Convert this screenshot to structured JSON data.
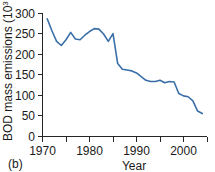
{
  "panel": {
    "label": "(b)"
  },
  "chart_data": {
    "type": "line",
    "title": "",
    "xlabel": "Year",
    "ylabel": "BOD mass emissions (10",
    "ylabel_sup": "3",
    "ylabel_tail": " mt)",
    "xlim": [
      1970,
      2005
    ],
    "ylim": [
      0,
      300
    ],
    "grid": false,
    "legend": "none",
    "xticks": [
      1970,
      1980,
      1990,
      2000
    ],
    "xtick_labels": [
      "1970",
      "1980",
      "1990",
      "2000"
    ],
    "xminorticks": [
      1975,
      1985,
      1995,
      2005
    ],
    "yticks": [
      0,
      50,
      100,
      150,
      200,
      250,
      300
    ],
    "ytick_labels": [
      "0",
      "50",
      "100",
      "150",
      "200",
      "250",
      "300"
    ],
    "line_color": "#3a6fa8",
    "series": [
      {
        "name": "BOD mass emissions",
        "x": [
          1971,
          1972,
          1973,
          1974,
          1975,
          1976,
          1977,
          1978,
          1979,
          1980,
          1981,
          1982,
          1983,
          1984,
          1985,
          1986,
          1987,
          1988,
          1989,
          1990,
          1991,
          1992,
          1993,
          1994,
          1995,
          1996,
          1997,
          1998,
          1999,
          2000,
          2001,
          2002,
          2003,
          2004
        ],
        "values": [
          287,
          258,
          232,
          222,
          236,
          254,
          238,
          236,
          247,
          256,
          263,
          262,
          250,
          232,
          251,
          178,
          164,
          162,
          160,
          155,
          146,
          137,
          134,
          134,
          137,
          131,
          134,
          133,
          105,
          99,
          97,
          87,
          62,
          56
        ]
      }
    ]
  }
}
